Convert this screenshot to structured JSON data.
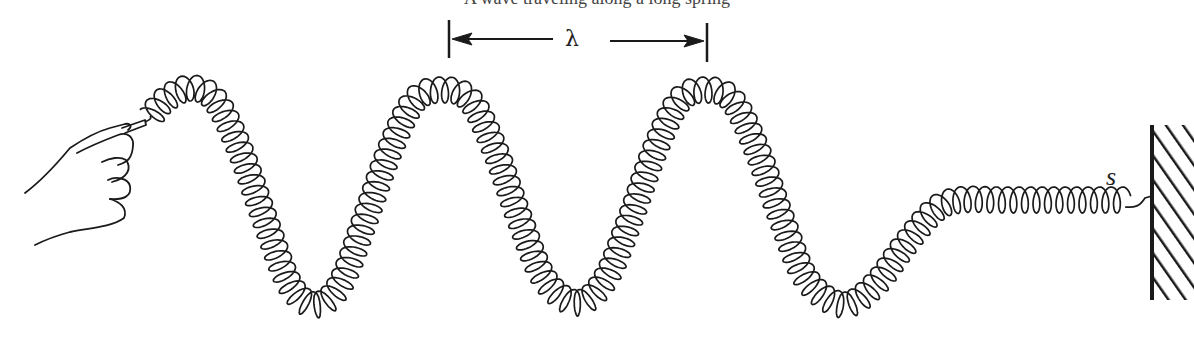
{
  "figure": {
    "caption_partial": "A wave traveling along a long spring",
    "wavelength_label": "λ",
    "spring_end_label": "s",
    "colors": {
      "ink": "#1a1a1a",
      "background": "#ffffff",
      "wall_fill": "#dddddd"
    }
  },
  "elements": {
    "hand": "hand holding spring end",
    "spring": "coiled spring carrying transverse wave",
    "wall": "fixed hatched wall support",
    "wavelength_marker": "dimension arrows spanning one wavelength between crests"
  },
  "geometry": {
    "crests_x": [
      190,
      443,
      706
    ],
    "troughs_x": [
      315,
      577,
      843
    ],
    "flat_section_y": 200,
    "wall_x": 1150
  }
}
